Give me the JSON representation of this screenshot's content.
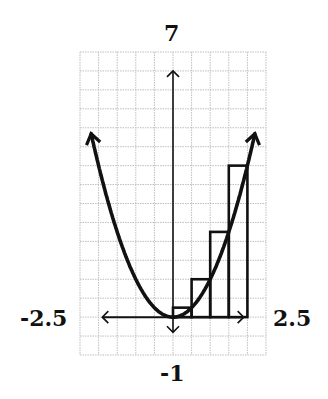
{
  "chart_data": {
    "type": "line",
    "title": "",
    "function": "y = x^2",
    "xlabel": "",
    "ylabel": "",
    "xlim": [
      -2.5,
      2.5
    ],
    "ylim": [
      -1,
      7
    ],
    "grid": true,
    "grid_step": 0.5,
    "axis_labels": {
      "top": "7",
      "bottom": "-1",
      "left": "-2.5",
      "right": "2.5"
    },
    "series": [
      {
        "name": "parabola",
        "x": [
          -2.2,
          -2.0,
          -1.5,
          -1.0,
          -0.5,
          0.0,
          0.5,
          1.0,
          1.5,
          2.0,
          2.2
        ],
        "y": [
          4.84,
          4.0,
          2.25,
          1.0,
          0.25,
          0.0,
          0.25,
          1.0,
          2.25,
          4.0,
          4.84
        ]
      }
    ],
    "riemann_rectangles": {
      "method": "right endpoints",
      "width": 0.5,
      "x_left": [
        0.0,
        0.5,
        1.0,
        1.5
      ],
      "x_right": [
        0.5,
        1.0,
        1.5,
        2.0
      ],
      "heights": [
        0.25,
        1.0,
        2.25,
        4.0
      ]
    },
    "colors": {
      "curve": "#111111",
      "grid": "#bfbfbf",
      "axes": "#111111"
    }
  }
}
